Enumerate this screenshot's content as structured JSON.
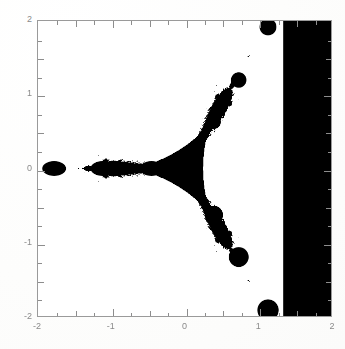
{
  "figure": {
    "kind": "scanned-mathematical-plot",
    "background_color": "#fefefe",
    "ink_color": "#000000",
    "axis_color": "#8d8d8d",
    "label_color": "#8a8a8a"
  },
  "chart_data": {
    "type": "scatter",
    "title": "",
    "subtitle": "",
    "xlabel": "",
    "ylabel": "",
    "xlim": [
      -2,
      2
    ],
    "ylim": [
      -2,
      2
    ],
    "grid": false,
    "legend": null,
    "x_major_ticks": [
      -2,
      -1,
      0,
      1,
      2
    ],
    "x_tick_labels": [
      "-2",
      "-1",
      "0",
      "1",
      "2"
    ],
    "y_major_ticks": [
      -2,
      -1,
      0,
      1,
      2
    ],
    "y_tick_labels": [
      "-2",
      "-1",
      "0",
      "1",
      "2"
    ],
    "minor_tick_step": 0.25,
    "major_tick_step": 1,
    "intermediate_tick_step": 0.5,
    "ticks_direction": "inward",
    "ticks_on_all_sides": true,
    "series": [
      {
        "name": "filled set",
        "fill_color": "#000000",
        "region_type": "area",
        "axial_leaf_centers_x": [
          -1.78,
          -1.12,
          -0.45
        ],
        "axial_cusps_x": [
          -2.0,
          -1.45,
          -0.8,
          0.0
        ],
        "upper_chain_nodes": [
          {
            "x": 0.4,
            "y": 0.63
          },
          {
            "x": 0.74,
            "y": 1.2
          },
          {
            "x": 1.14,
            "y": 1.92
          }
        ],
        "lower_chain_nodes": [
          {
            "x": 0.4,
            "y": -0.63
          },
          {
            "x": 0.74,
            "y": -1.2
          },
          {
            "x": 1.14,
            "y": -1.92
          }
        ],
        "solid_region_left_edge_x": 1.35,
        "symmetry": "mirror about the real axis"
      }
    ]
  },
  "axes": {
    "y_labels": [
      {
        "text": "2",
        "value": 2
      },
      {
        "text": "1",
        "value": 1
      },
      {
        "text": "0",
        "value": 0
      },
      {
        "text": "-1",
        "value": -1
      },
      {
        "text": "-2",
        "value": -2
      }
    ],
    "x_labels": [
      {
        "text": "-2",
        "value": -2
      },
      {
        "text": "-1",
        "value": -1
      },
      {
        "text": "0",
        "value": 0
      },
      {
        "text": "1",
        "value": 1
      },
      {
        "text": "2",
        "value": 2
      }
    ]
  }
}
